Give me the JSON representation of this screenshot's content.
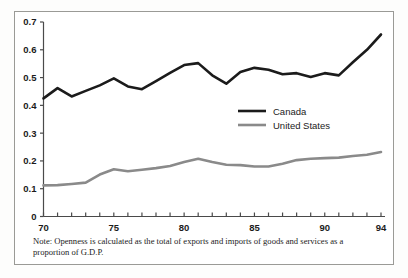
{
  "figure": {
    "background_color": "#ffffff",
    "frame_color": "#9a9a96"
  },
  "note": {
    "text": "Note: Openness is calculated as the total of exports and imports of goods and services as a proportion of G.D.P."
  },
  "legend": {
    "position": "inside-center-right",
    "entries": [
      {
        "label": "Canada",
        "color": "#1b1b1b"
      },
      {
        "label": "United States",
        "color": "#8a8a8a"
      }
    ]
  },
  "chart_data": {
    "type": "line",
    "title": "",
    "xlabel": "",
    "ylabel": "",
    "xlim": [
      70,
      94
    ],
    "ylim": [
      0,
      0.7
    ],
    "grid": false,
    "x": [
      70,
      71,
      72,
      73,
      74,
      75,
      76,
      77,
      78,
      79,
      80,
      81,
      82,
      83,
      84,
      85,
      86,
      87,
      88,
      89,
      90,
      91,
      92,
      93,
      94
    ],
    "xtick_values": [
      70,
      71,
      72,
      73,
      74,
      75,
      76,
      77,
      78,
      79,
      80,
      81,
      82,
      83,
      84,
      85,
      86,
      87,
      88,
      89,
      90,
      91,
      92,
      93,
      94
    ],
    "xtick_labels_shown": [
      "70",
      "75",
      "80",
      "85",
      "90",
      "94"
    ],
    "xtick_labels_shown_values": [
      70,
      75,
      80,
      85,
      90,
      94
    ],
    "ytick_values": [
      0,
      0.1,
      0.2,
      0.3,
      0.4,
      0.5,
      0.6,
      0.7
    ],
    "ytick_labels": [
      "0",
      "0.1",
      "0.2",
      "0.3",
      "0.4",
      "0.5",
      "0.6",
      "0.7"
    ],
    "series": [
      {
        "name": "Canada",
        "color": "#1b1b1b",
        "width": 2.6,
        "values": [
          0.425,
          0.462,
          0.432,
          0.452,
          0.472,
          0.497,
          0.468,
          0.458,
          0.487,
          0.517,
          0.545,
          0.552,
          0.508,
          0.478,
          0.52,
          0.535,
          0.528,
          0.512,
          0.516,
          0.502,
          0.516,
          0.508,
          0.555,
          0.6,
          0.655
        ]
      },
      {
        "name": "United States",
        "color": "#8a8a8a",
        "width": 2.6,
        "values": [
          0.112,
          0.113,
          0.117,
          0.122,
          0.151,
          0.17,
          0.163,
          0.168,
          0.174,
          0.182,
          0.196,
          0.208,
          0.196,
          0.186,
          0.185,
          0.18,
          0.18,
          0.19,
          0.203,
          0.208,
          0.21,
          0.212,
          0.218,
          0.222,
          0.232
        ]
      }
    ]
  }
}
